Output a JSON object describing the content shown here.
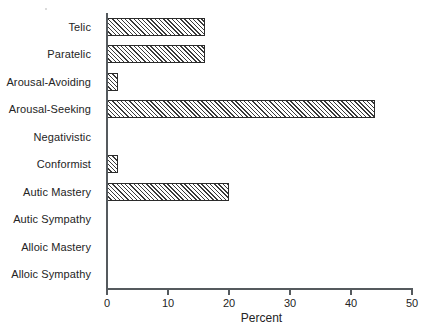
{
  "chart_data": {
    "type": "bar",
    "orientation": "horizontal",
    "title": "",
    "xlabel": "Percent",
    "ylabel": "",
    "categories": [
      "Telic",
      "Paratelic",
      "Arousal-Avoiding",
      "Arousal-Seeking",
      "Negativistic",
      "Conformist",
      "Autic Mastery",
      "Autic Sympathy",
      "Alloic Mastery",
      "Alloic Sympathy"
    ],
    "values": [
      16,
      16,
      1.8,
      44,
      0,
      1.8,
      20,
      0,
      0,
      0
    ],
    "xlim": [
      0,
      50
    ],
    "xticks": [
      0,
      10,
      20,
      30,
      40,
      50
    ],
    "xtick_labels": [
      "0",
      "10",
      "20",
      "30",
      "40",
      "50"
    ],
    "grid": false,
    "legend": false,
    "bar_fill": "diagonal-hatch",
    "bar_edge_color": "#2b2b2b",
    "axis_color": "#555a5e",
    "background_color": "#ffffff"
  }
}
